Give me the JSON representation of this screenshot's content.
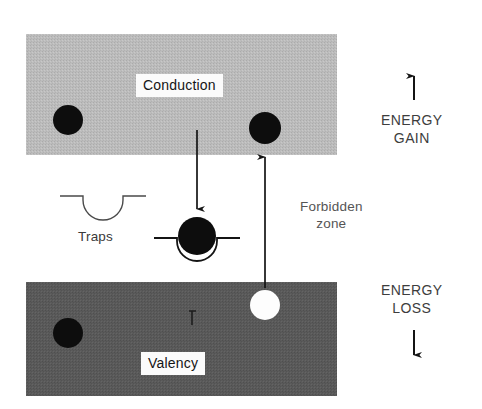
{
  "figure": {
    "width": 482,
    "height": 409
  },
  "bands": {
    "conduction": {
      "label": "Conduction",
      "fill": "#b9b9b9",
      "x": 26,
      "y": 34,
      "width": 311,
      "height": 121,
      "label_x": 136,
      "label_y": 74
    },
    "valency": {
      "label": "Valency",
      "fill": "#585858",
      "x": 26,
      "y": 282,
      "width": 311,
      "height": 114,
      "label_x": 141,
      "label_y": 352
    }
  },
  "traps": {
    "label": "Traps",
    "label_x": 78,
    "label_y": 228,
    "empty_well": {
      "cx": 103,
      "cy": 196,
      "radius": 20,
      "line_span": 43
    },
    "filled_well": {
      "cx": 197,
      "cy": 238,
      "radius": 20,
      "line_span": 43
    }
  },
  "forbidden_zone": {
    "line1": "Forbidden",
    "line2": "zone",
    "x": 300,
    "y": 198
  },
  "carriers": [
    {
      "name": "electron-conduction-left",
      "type": "electron",
      "fill": "#0d0d0d",
      "cx": 68,
      "cy": 120,
      "r": 15
    },
    {
      "name": "electron-conduction-right",
      "type": "electron",
      "fill": "#0d0d0d",
      "cx": 265,
      "cy": 128,
      "r": 16
    },
    {
      "name": "electron-trapped",
      "type": "electron",
      "fill": "#0d0d0d",
      "cx": 197,
      "cy": 236,
      "r": 19
    },
    {
      "name": "electron-valency-left",
      "type": "electron",
      "fill": "#0d0d0d",
      "cx": 68,
      "cy": 333,
      "r": 15
    },
    {
      "name": "hole-valency-right",
      "type": "hole",
      "fill": "#fdfdfd",
      "cx": 265,
      "cy": 305,
      "r": 15
    }
  ],
  "transitions": [
    {
      "name": "trapping-arrow",
      "direction": "down",
      "description": "electron falls from conduction band into trap",
      "x": 197,
      "y_start": 130,
      "y_end": 216
    },
    {
      "name": "excitation-arrow",
      "direction": "up",
      "description": "electron excited from valency band to conduction band",
      "x": 265,
      "y_start": 288,
      "y_end": 150
    }
  ],
  "energy_axes": {
    "gain": {
      "line1": "ENERGY",
      "line2": "GAIN",
      "arrow_direction": "up",
      "text_x": 381,
      "text_y": 111,
      "arrow_x": 414,
      "arrow_top": 69,
      "arrow_bottom": 100
    },
    "loss": {
      "line1": "ENERGY",
      "line2": "LOSS",
      "arrow_direction": "down",
      "text_x": 381,
      "text_y": 281,
      "arrow_x": 414,
      "arrow_top": 330,
      "arrow_bottom": 362
    }
  },
  "colors": {
    "ink": "#1a1a1a",
    "conduction_fill": "#b9b9b9",
    "valency_fill": "#585858",
    "paper": "#ffffff"
  }
}
